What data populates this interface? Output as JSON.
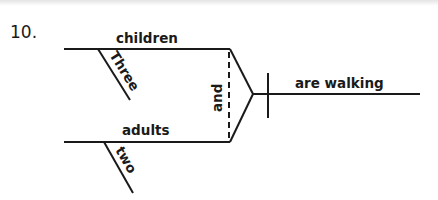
{
  "diagram": {
    "item_number": "10.",
    "compound_subject": {
      "top": {
        "noun": "children",
        "modifier": "Three"
      },
      "bottom": {
        "noun": "adults",
        "modifier": "two"
      },
      "conjunction": "and"
    },
    "predicate": "are walking",
    "line_color": "#1a1a1a"
  }
}
